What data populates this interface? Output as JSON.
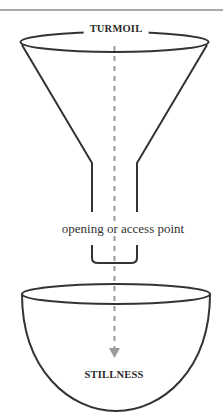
{
  "diagram": {
    "type": "funnel-into-bowl",
    "labels": {
      "top": "TURMOIL",
      "middle": "opening or access point",
      "bottom": "STILLNESS"
    },
    "flow": {
      "direction": "downward",
      "from": "TURMOIL",
      "through": "opening or access point",
      "to": "STILLNESS",
      "style": "dashed-arrow"
    },
    "colors": {
      "outline": "#333333",
      "flow_arrow": "#9a9a9a",
      "text": "#2a2a2a",
      "background": "#ffffff"
    }
  }
}
